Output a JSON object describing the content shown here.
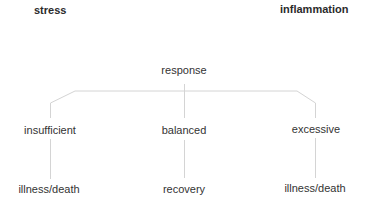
{
  "diagram": {
    "headers": {
      "left": "stress",
      "right": "inflammation"
    },
    "root": {
      "label": "response"
    },
    "branches": [
      {
        "label": "insufficient",
        "outcome": "illness/death"
      },
      {
        "label": "balanced",
        "outcome": "recovery"
      },
      {
        "label": "excessive",
        "outcome": "illness/death"
      }
    ],
    "colors": {
      "text": "#333333",
      "line": "#d4d4d4"
    }
  }
}
